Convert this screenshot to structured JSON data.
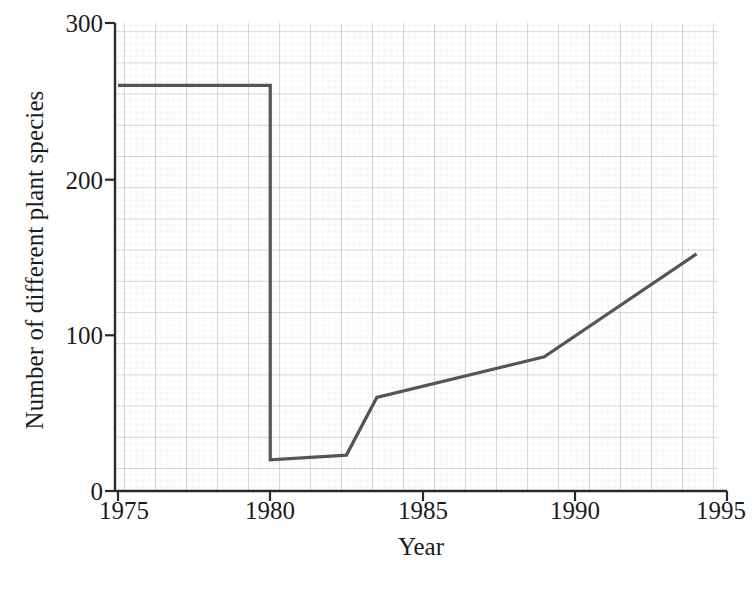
{
  "chart_data": {
    "type": "line",
    "title": "",
    "xlabel": "Year",
    "ylabel": "Number of different plant species",
    "xlim": [
      1975,
      1995
    ],
    "ylim": [
      0,
      300
    ],
    "xticks": [
      1975,
      1980,
      1985,
      1990,
      1995
    ],
    "yticks": [
      0,
      100,
      200,
      300
    ],
    "xtick_labels": [
      "1975",
      "1980",
      "1985",
      "1990",
      "1995"
    ],
    "ytick_labels": [
      "0",
      "100",
      "200",
      "300"
    ],
    "grid": true,
    "grid_major_step_x": 1,
    "grid_major_step_y": 20,
    "grid_minor_divisions": 5,
    "legend": "none",
    "series": [
      {
        "name": "Number of different plant species",
        "color": "#555555",
        "x": [
          1975,
          1980,
          1980,
          1982.5,
          1983.5,
          1989,
          1994
        ],
        "values": [
          260,
          260,
          20,
          23,
          60,
          86,
          152
        ],
        "points": [
          {
            "x": 1975,
            "y": 260
          },
          {
            "x": 1980,
            "y": 260
          },
          {
            "x": 1980,
            "y": 20
          },
          {
            "x": 1982.5,
            "y": 23
          },
          {
            "x": 1983.5,
            "y": 60
          },
          {
            "x": 1989,
            "y": 86
          },
          {
            "x": 1994,
            "y": 152
          }
        ]
      }
    ]
  },
  "axes": {
    "y_label": "Number of different plant species",
    "x_label": "Year",
    "y_tick_0": "0",
    "y_tick_1": "100",
    "y_tick_2": "200",
    "y_tick_3": "300",
    "x_tick_0": "1975",
    "x_tick_1": "1980",
    "x_tick_2": "1985",
    "x_tick_3": "1990",
    "x_tick_4": "1995"
  },
  "colors": {
    "line": "#555555",
    "axis": "#2b2b2b",
    "grid_major": "#b9bcc6",
    "grid_minor": "#dcdee5",
    "background": "#ffffff"
  }
}
